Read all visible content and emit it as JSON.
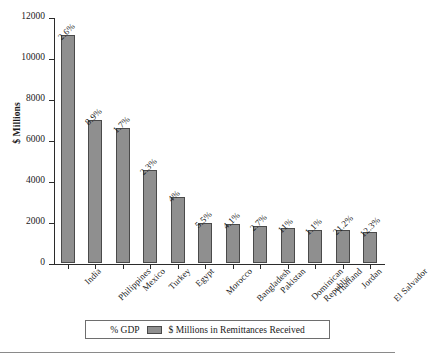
{
  "chart_data": {
    "type": "bar",
    "title": "",
    "xlabel": "",
    "ylabel": "$ Millions",
    "ylim": [
      0,
      12000
    ],
    "ytick_step": 2000,
    "yticks": [
      "0",
      "2000",
      "4000",
      "6000",
      "8000",
      "10000",
      "12000"
    ],
    "grid": false,
    "legend_position": "bottom",
    "categories": [
      "India",
      "Philippines",
      "Mexico",
      "Turkey",
      "Egypt",
      "Morocco",
      "Bangladesh",
      "Dominican Republic",
      "Pakistan",
      "Thailand",
      "Jordan",
      "El Salvador"
    ],
    "series": [
      {
        "name": "$ Millions in Remittances Received",
        "values": [
          11100,
          7000,
          6600,
          4550,
          3200,
          1950,
          1900,
          1800,
          1700,
          1600,
          1600,
          1500
        ]
      }
    ],
    "annotations": {
      "name": "% GDP",
      "values": [
        "2.6%",
        "8.9%",
        "1.7%",
        "2.3%",
        "4%",
        "5.5%",
        "4.1%",
        "2.7%",
        "11%",
        "1.1%",
        "21.2%",
        "12.3%"
      ]
    },
    "bars": [
      {
        "category": "India",
        "label_line1": "India",
        "label_line2": "",
        "value": 11100,
        "gdp": "2.6%"
      },
      {
        "category": "Philippines",
        "label_line1": "Philippines",
        "label_line2": "",
        "value": 7000,
        "gdp": "8.9%"
      },
      {
        "category": "Mexico",
        "label_line1": "Mexico",
        "label_line2": "",
        "value": 6600,
        "gdp": "1.7%"
      },
      {
        "category": "Turkey",
        "label_line1": "Turkey",
        "label_line2": "",
        "value": 4550,
        "gdp": "2.3%"
      },
      {
        "category": "Egypt",
        "label_line1": "Egypt",
        "label_line2": "",
        "value": 3200,
        "gdp": "4%"
      },
      {
        "category": "Morocco",
        "label_line1": "Morocco",
        "label_line2": "",
        "value": 1950,
        "gdp": "5.5%"
      },
      {
        "category": "Bangladesh",
        "label_line1": "Bangladesh",
        "label_line2": "",
        "value": 1900,
        "gdp": "4.1%"
      },
      {
        "category": "Pakistan",
        "label_line1": "Pakistan",
        "label_line2": "",
        "value": 1800,
        "gdp": "2.7%"
      },
      {
        "category": "Dominican Republic",
        "label_line1": "Dominican",
        "label_line2": "Republic",
        "value": 1700,
        "gdp": "11%"
      },
      {
        "category": "Thailand",
        "label_line1": "Thailand",
        "label_line2": "",
        "value": 1600,
        "gdp": "1.1%"
      },
      {
        "category": "Jordan",
        "label_line1": "Jordan",
        "label_line2": "",
        "value": 1600,
        "gdp": "21.2%"
      },
      {
        "category": "El Salvador",
        "label_line1": "El Salvador",
        "label_line2": "",
        "value": 1500,
        "gdp": "12.3%"
      }
    ]
  },
  "legend": {
    "gdp_label": "% GDP",
    "series_label": "$ Millions in Remittances Received"
  },
  "colors": {
    "bar_fill": "#8f8f8f",
    "bar_stroke": "#4a4a4a",
    "axis": "#2b2b2b",
    "text": "#1a1a1a"
  }
}
